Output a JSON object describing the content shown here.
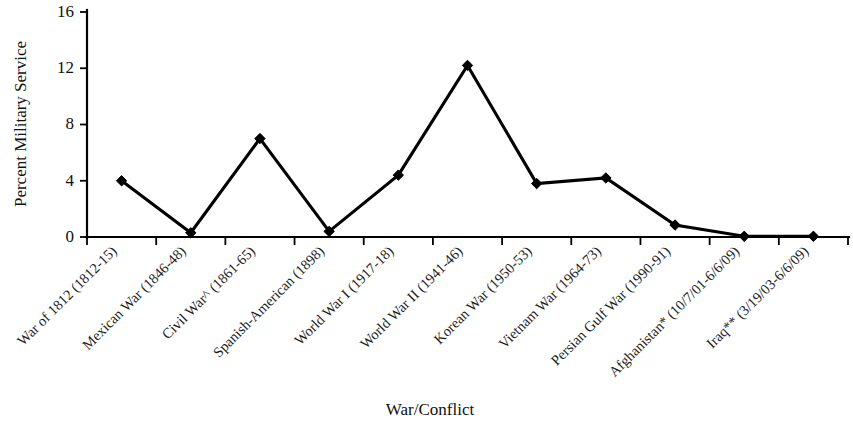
{
  "chart_data": {
    "type": "line",
    "title": "",
    "xlabel": "War/Conflict",
    "ylabel": "Percent Military Service",
    "categories": [
      "War of 1812 (1812-15)",
      "Mexican War (1846-48)",
      "Civil War^ (1861-65)",
      "Spanish-American (1898)",
      "World War I (1917-18)",
      "World War II (1941-46)",
      "Korean War (1950-53)",
      "Vietnam War (1964-73)",
      "Persian Gulf War (1990-91)",
      "Afghanistan* (10/7/01-6/6/09)",
      "Iraq** (3/19/03-6/6/09)"
    ],
    "values": [
      4.0,
      0.3,
      7.0,
      0.4,
      4.4,
      12.2,
      3.8,
      4.2,
      0.85,
      0.05,
      0.05
    ],
    "ylim": [
      0,
      16
    ],
    "yticks": [
      0,
      4,
      8,
      12,
      16
    ],
    "ytick_labels": [
      "0",
      "4",
      "8",
      "12",
      "16"
    ],
    "grid": false,
    "legend": "none",
    "marker": "diamond",
    "line_color": "#000000",
    "marker_color": "#000000"
  },
  "axes": {
    "y_axis_title": "Percent Military Service",
    "x_axis_title": "War/Conflict"
  }
}
